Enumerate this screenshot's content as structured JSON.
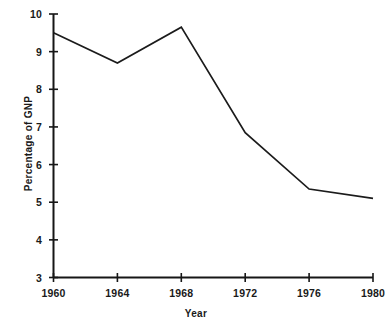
{
  "chart_data": {
    "type": "line",
    "title": "",
    "xlabel": "Year",
    "ylabel": "Percentage of GNP",
    "x": [
      1960,
      1964,
      1968,
      1972,
      1976,
      1980
    ],
    "values": [
      9.5,
      8.7,
      9.65,
      6.85,
      5.35,
      5.1
    ],
    "series": [
      {
        "name": "Percentage of GNP",
        "values": [
          9.5,
          8.7,
          9.65,
          6.85,
          5.35,
          5.1
        ]
      }
    ],
    "xlim": [
      1960,
      1980
    ],
    "ylim": [
      3,
      10
    ],
    "x_ticks": [
      "1960",
      "1964",
      "1968",
      "1972",
      "1976",
      "1980"
    ],
    "y_ticks": [
      "3",
      "4",
      "5",
      "6",
      "7",
      "8",
      "9",
      "10"
    ],
    "grid": false,
    "legend": false,
    "legend_position": "none",
    "line_color": "#1b1b1b",
    "axis_color": "#161616",
    "background_color": "#ffffff"
  },
  "axes": {
    "y_title": "Percentage of GNP",
    "x_title": "Year"
  }
}
